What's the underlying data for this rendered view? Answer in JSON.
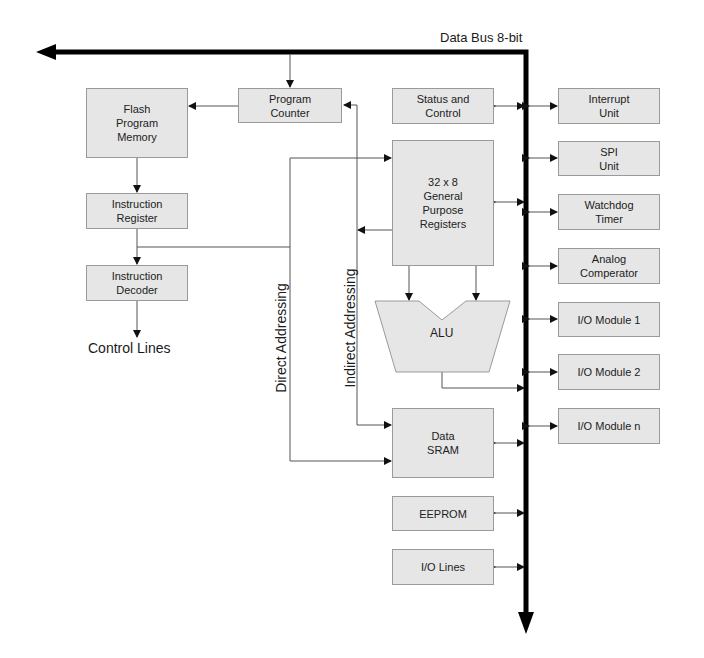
{
  "diagram": {
    "bus_label": "Data Bus 8-bit",
    "control_lines_label": "Control Lines",
    "direct_addressing_label": "Direct Addressing",
    "indirect_addressing_label": "Indirect Addressing",
    "blocks": {
      "flash": "Flash\nProgram\nMemory",
      "program_counter": "Program\nCounter",
      "instruction_register": "Instruction\nRegister",
      "instruction_decoder": "Instruction\nDecoder",
      "status_control": "Status and\nControl",
      "gpr": "32 x 8\nGeneral\nPurpose\nRegisters",
      "alu": "ALU",
      "data_sram": "Data\nSRAM",
      "eeprom": "EEPROM",
      "io_lines": "I/O Lines",
      "interrupt_unit": "Interrupt\nUnit",
      "spi_unit": "SPI\nUnit",
      "watchdog_timer": "Watchdog\nTimer",
      "analog_comparator": "Analog\nComperator",
      "io_module_1": "I/O Module 1",
      "io_module_2": "I/O Module 2",
      "io_module_n": "I/O Module n"
    },
    "colors": {
      "block_fill": "#e6e6e6",
      "block_border": "#9a9a9a",
      "bus": "#000000",
      "wire": "#555555"
    }
  }
}
